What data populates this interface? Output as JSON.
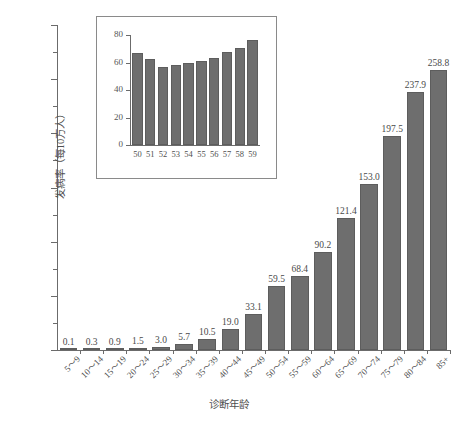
{
  "chart_data": {
    "type": "bar",
    "title": "",
    "xlabel": "诊断年龄",
    "ylabel": "发病率（每10万人）",
    "ylim": [
      0,
      300
    ],
    "ytick_values": [
      0,
      50,
      100,
      150,
      200,
      250,
      300
    ],
    "ytick_labels": [
      "0",
      "50",
      "100",
      "150",
      "200",
      "250",
      "300"
    ],
    "yminor_values": [
      25,
      75,
      125,
      175,
      225,
      275
    ],
    "grid": false,
    "legend": "none",
    "categories": [
      "5～9",
      "10～14",
      "15～19",
      "20～24",
      "25～29",
      "30～34",
      "35～39",
      "40～44",
      "45～49",
      "50～54",
      "55～59",
      "60～64",
      "65～69",
      "70～74",
      "75～79",
      "80～84",
      "85+"
    ],
    "values": [
      0.1,
      0.3,
      0.9,
      1.5,
      3.0,
      5.7,
      10.5,
      19.0,
      33.1,
      59.5,
      68.4,
      90.2,
      121.4,
      153.0,
      197.5,
      237.9,
      258.8
    ],
    "data_labels": [
      "0.1",
      "0.3",
      "0.9",
      "1.5",
      "3.0",
      "5.7",
      "10.5",
      "19.0",
      "33.1",
      "59.5",
      "68.4",
      "90.2",
      "121.4",
      "153.0",
      "197.5",
      "237.9",
      "258.8"
    ],
    "bar_color": "#6e6e6e",
    "inset": {
      "type": "bar",
      "xlabel": "",
      "ylabel": "",
      "ylim": [
        0,
        80
      ],
      "ytick_values": [
        0,
        20,
        40,
        60,
        80
      ],
      "ytick_labels": [
        "0",
        "20",
        "40",
        "60",
        "80"
      ],
      "categories": [
        "50",
        "51",
        "52",
        "53",
        "54",
        "55",
        "56",
        "57",
        "58",
        "59"
      ],
      "values": [
        67.0,
        62.5,
        57.0,
        58.5,
        59.5,
        61.0,
        63.5,
        67.5,
        70.5,
        76.5
      ],
      "bar_color": "#6e6e6e"
    }
  },
  "caption": {
    "bottom_text": ""
  }
}
